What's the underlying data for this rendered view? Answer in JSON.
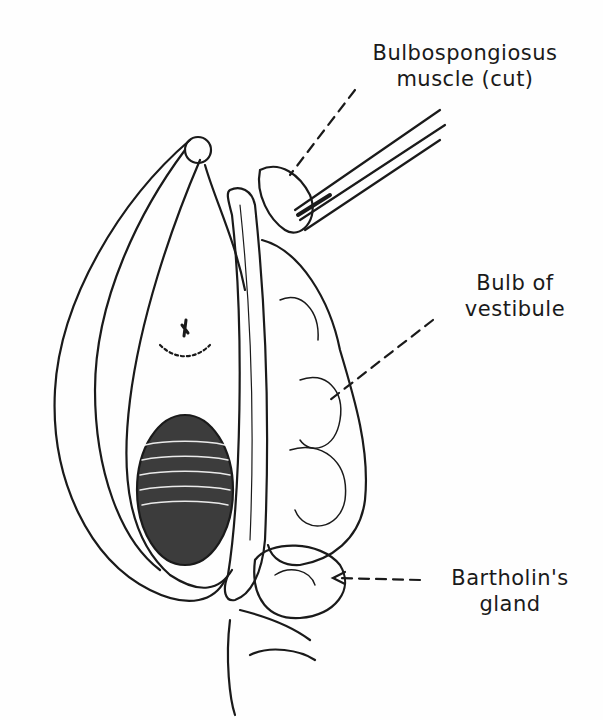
{
  "figure": {
    "labels": [
      {
        "id": "bulbospongiosus",
        "line1": "Bulbospongiosus",
        "line2": "muscle (cut)"
      },
      {
        "id": "bulb",
        "line1": "Bulb of",
        "line2": "vestibule"
      },
      {
        "id": "bartholin",
        "line1": "Bartholin's",
        "line2": "gland"
      }
    ],
    "colors": {
      "ink": "#1a1a1a",
      "paper": "#fefefe"
    }
  }
}
